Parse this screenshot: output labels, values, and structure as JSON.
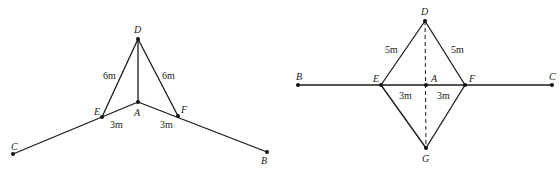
{
  "figure_left": {
    "points": {
      "D": "D",
      "A": "A",
      "E": "E",
      "F": "F",
      "C": "C",
      "B": "B"
    },
    "lengths": {
      "DE": "6m",
      "DF": "6m",
      "EA": "3m",
      "AF": "3m"
    }
  },
  "figure_right": {
    "points": {
      "D": "D",
      "A": "A",
      "E": "E",
      "F": "F",
      "G": "G",
      "B": "B",
      "C": "C"
    },
    "lengths": {
      "DE": "5m",
      "DF": "5m",
      "EA": "3m",
      "AF": "3m"
    }
  }
}
